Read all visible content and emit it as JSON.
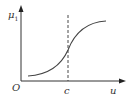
{
  "diagram": {
    "type": "membership-function-s-curve",
    "y_axis_label": "μ",
    "y_axis_subscript": "1",
    "origin_label": "O",
    "x_axis_label": "u",
    "marker_label": "c",
    "colors": {
      "axis": "#333333",
      "curve": "#444444",
      "dashed_line": "#333333",
      "background": "#ffffff"
    }
  }
}
